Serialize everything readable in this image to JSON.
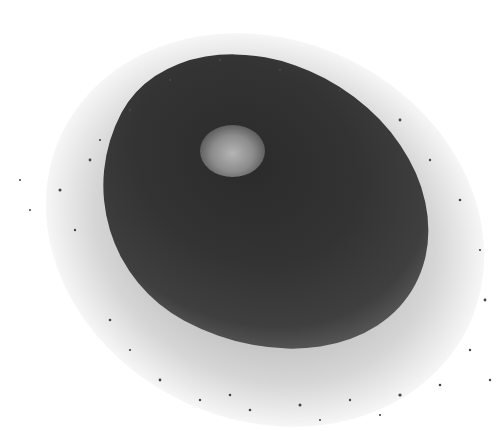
{
  "image": {
    "subject": "pile of dark granular powder on white background",
    "colors": {
      "background": "#ffffff",
      "pile_dark": "#2b2b2b",
      "pile_mid": "#3f3f3f",
      "highlight": "#b5b5b5"
    }
  }
}
